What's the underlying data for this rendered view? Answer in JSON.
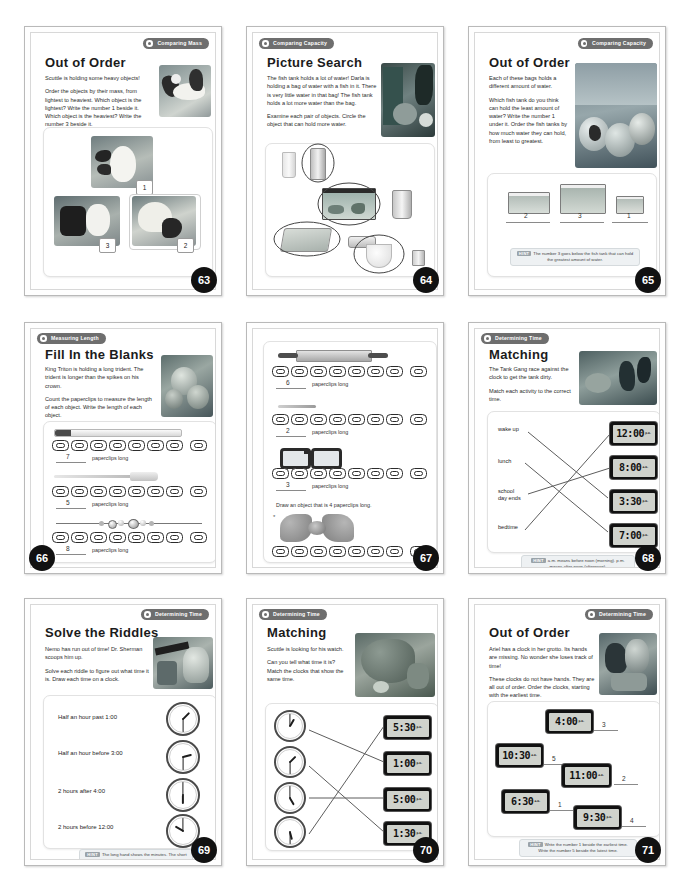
{
  "document": {
    "kind": "workbook-scan",
    "layout": "3x3 grid of worksheet pages"
  },
  "pages": [
    {
      "number": "63",
      "badge": "Comparing Mass",
      "badge_side": "right",
      "title": "Out of Order",
      "body": [
        "Scuttle is holding some heavy objects!",
        "Order the objects by their mass, from lightest to heaviest. Which object is the lightest? Write the number 1 beside it. Which object is the heaviest? Write the number 3 beside it."
      ],
      "answers": [
        "1",
        "3",
        "2"
      ],
      "hint": null
    },
    {
      "number": "64",
      "badge": "Comparing Capacity",
      "badge_side": "left",
      "title": "Picture Search",
      "body": [
        "The fish tank holds a lot of water! Darla is holding a bag of water with a fish in it. There is very little water in that bag! The fish tank holds a lot more water than the bag.",
        "Examine each pair of objects. Circle the object that can hold more water."
      ],
      "answers": [],
      "hint": null
    },
    {
      "number": "65",
      "badge": "Comparing Capacity",
      "badge_side": "right",
      "title": "Out of Order",
      "body": [
        "Each of these bags holds a different amount of water.",
        "Which fish tank do you think can hold the least amount of water? Write the number 1 under it. Order the fish tanks by how much water they can hold, from least to greatest."
      ],
      "answers": [
        "2",
        "3",
        "1"
      ],
      "hint": {
        "label": "HINT",
        "text": "The number 3 goes below the fish tank that can hold the greatest amount of water."
      }
    },
    {
      "number": "66",
      "badge": "Measuring Length",
      "badge_side": "left",
      "title": "Fill In the Blanks",
      "body": [
        "King Triton is holding a long trident. The trident is longer than the spikes on his crown.",
        "Count the paperclips to measure the length of each object. Write the length of each object."
      ],
      "measurements": [
        {
          "object": "pencil",
          "value": "7",
          "unit": "paperclips long"
        },
        {
          "object": "fork",
          "value": "5",
          "unit": "paperclips long"
        },
        {
          "object": "necklace",
          "value": "8",
          "unit": "paperclips long"
        }
      ],
      "hint": null
    },
    {
      "number": "67",
      "badge": null,
      "badge_side": "left",
      "title": null,
      "body": [],
      "measurements": [
        {
          "object": "rolling pin",
          "value": "6",
          "unit": "paperclips long"
        },
        {
          "object": "stick",
          "value": "2",
          "unit": "paperclips long"
        },
        {
          "object": "glasses",
          "value": "3",
          "unit": "paperclips long"
        }
      ],
      "prompt": "Draw an object that is 4 paperclips long.",
      "hint": null
    },
    {
      "number": "68",
      "badge": "Determining Time",
      "badge_side": "left",
      "title": "Matching",
      "body": [
        "The Tank Gang race against the clock to get the tank dirty.",
        "Match each activity to the correct time."
      ],
      "activities": [
        "wake up",
        "lunch",
        "school day ends",
        "bedtime"
      ],
      "times": [
        {
          "time": "12:00",
          "meridiem": "p.m."
        },
        {
          "time": "8:00",
          "meridiem": "a.m."
        },
        {
          "time": "3:30",
          "meridiem": "p.m."
        },
        {
          "time": "7:00",
          "meridiem": "p.m."
        }
      ],
      "matches": [
        [
          0,
          1
        ],
        [
          1,
          2
        ],
        [
          2,
          3
        ],
        [
          3,
          0
        ]
      ],
      "hint": {
        "label": "HINT",
        "text": "a.m. means before noon (morning). p.m. means after noon (afternoon)."
      }
    },
    {
      "number": "69",
      "badge": "Determining Time",
      "badge_side": "right",
      "title": "Solve the Riddles",
      "body": [
        "Nemo has run out of time! Dr. Sherman scoops him up.",
        "Solve each riddle to figure out what time it is. Draw each time on a clock."
      ],
      "riddles": [
        {
          "text": "Half an hour past 1:00",
          "hour": 1,
          "minute": 30
        },
        {
          "text": "Half an hour before 3:00",
          "hour": 2,
          "minute": 30
        },
        {
          "text": "2 hours after 4:00",
          "hour": 6,
          "minute": 0
        },
        {
          "text": "2 hours before 12:00",
          "hour": 10,
          "minute": 0
        }
      ],
      "hint": {
        "label": "HINT",
        "text": "The long hand shows the minutes. The short hand shows the hours."
      }
    },
    {
      "number": "70",
      "badge": "Determining Time",
      "badge_side": "left",
      "title": "Matching",
      "body": [
        "Scuttle is looking for his watch.",
        "Can you tell what time it is? Match the clocks that show the same time."
      ],
      "clocks": [
        {
          "hour": 1,
          "minute": 0
        },
        {
          "hour": 1,
          "minute": 30
        },
        {
          "hour": 5,
          "minute": 0
        },
        {
          "hour": 5,
          "minute": 30
        }
      ],
      "times": [
        {
          "time": "5:30",
          "meridiem": "p.m."
        },
        {
          "time": "1:00",
          "meridiem": "p.m."
        },
        {
          "time": "5:00",
          "meridiem": "p.m."
        },
        {
          "time": "1:30",
          "meridiem": "p.m."
        }
      ],
      "matches": [
        [
          0,
          1
        ],
        [
          1,
          3
        ],
        [
          2,
          2
        ],
        [
          3,
          0
        ]
      ],
      "hint": null
    },
    {
      "number": "71",
      "badge": "Determining Time",
      "badge_side": "right",
      "title": "Out of Order",
      "body": [
        "Ariel has a clock in her grotto. Its hands are missing. No wonder she loses track of time!",
        "These clocks do not have hands. They are all out of order. Order the clocks, starting with the earliest time."
      ],
      "clocks": [
        {
          "time": "4:00",
          "meridiem": "p.m.",
          "answer": "3"
        },
        {
          "time": "10:30",
          "meridiem": "a.m.",
          "answer": "5"
        },
        {
          "time": "11:00",
          "meridiem": "a.m.",
          "answer": "2"
        },
        {
          "time": "6:30",
          "meridiem": "a.m.",
          "answer": "1"
        },
        {
          "time": "9:30",
          "meridiem": "p.m.",
          "answer": "4"
        }
      ],
      "hint": {
        "label": "HINT",
        "text": "Write the number 1 beside the earliest time. Write the number 5 beside the latest time."
      }
    }
  ]
}
